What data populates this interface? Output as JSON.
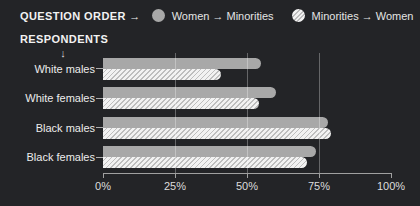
{
  "legend": {
    "title": "QUESTION ORDER →",
    "items": [
      {
        "label": "Women → Minorities",
        "swatch": "solid-circle"
      },
      {
        "label": "Minorities → Women",
        "swatch": "hatched-circle"
      }
    ]
  },
  "axis_header": {
    "label": "RESPONDENTS",
    "arrow": "↓"
  },
  "colors": {
    "background": "#232427",
    "solid_bar": "#a8a8a8",
    "hatch_base": "#f2f2f2",
    "hatch_stripe": "#bebebe",
    "axis": "#a0a0a0",
    "text": "#ececec"
  },
  "chart_data": {
    "type": "bar",
    "orientation": "horizontal",
    "title": "",
    "xlabel": "",
    "ylabel": "RESPONDENTS",
    "categories": [
      "White males",
      "White females",
      "Black males",
      "Black females"
    ],
    "series": [
      {
        "name": "Women → Minorities",
        "style": "solid",
        "values": [
          55,
          60,
          78,
          74
        ]
      },
      {
        "name": "Minorities → Women",
        "style": "hatched",
        "values": [
          41,
          54,
          79,
          71
        ]
      }
    ],
    "xlim": [
      0,
      100
    ],
    "unit": "%",
    "x_ticks": [
      0,
      25,
      50,
      75,
      100
    ],
    "x_tick_labels": [
      "0%",
      "25%",
      "50%",
      "75%",
      "100%"
    ],
    "gridlines_at": [
      25,
      50,
      75
    ],
    "grid": "vertical",
    "legend_position": "top"
  }
}
